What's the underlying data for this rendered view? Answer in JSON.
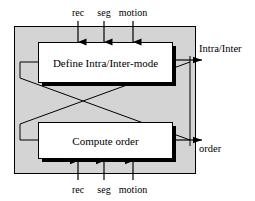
{
  "diagram": {
    "panel": {
      "fill_color": "#d4d4d4",
      "border_color": "#000000"
    },
    "boxes": [
      {
        "id": "define-mode",
        "label": "Define Intra/Inter-mode",
        "fill_color": "#ffffff",
        "border_color": "#000000",
        "shadow_color": "#000000"
      },
      {
        "id": "compute-order",
        "label": "Compute order",
        "fill_color": "#ffffff",
        "border_color": "#000000",
        "shadow_color": "#000000"
      }
    ],
    "top_inputs": [
      {
        "label": "rec"
      },
      {
        "label": "seg"
      },
      {
        "label": "motion"
      }
    ],
    "bottom_inputs": [
      {
        "label": "rec"
      },
      {
        "label": "seg"
      },
      {
        "label": "motion"
      }
    ],
    "outputs": [
      {
        "id": "intra-inter",
        "label": "Intra/Inter"
      },
      {
        "id": "order",
        "label": "order"
      }
    ]
  }
}
